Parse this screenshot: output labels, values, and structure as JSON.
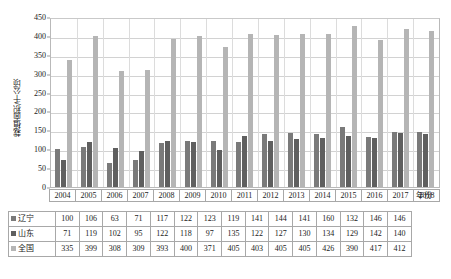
{
  "chart_data": {
    "type": "bar",
    "title": "",
    "xlabel": "年份",
    "ylabel": "栽植面积/千公顷",
    "ylim": [
      0,
      450
    ],
    "ytick_step": 50,
    "yticks": [
      0,
      50,
      100,
      150,
      200,
      250,
      300,
      350,
      400,
      450
    ],
    "grid": true,
    "legend_position": "table-rows",
    "categories": [
      "2004",
      "2005",
      "2006",
      "2007",
      "2008",
      "2009",
      "2010",
      "2011",
      "2012",
      "2013",
      "2014",
      "2015",
      "2016",
      "2017",
      "2018"
    ],
    "series": [
      {
        "name": "辽宁",
        "color": "#7a7a7a",
        "values": [
          100,
          106,
          63,
          71,
          117,
          122,
          123,
          119,
          141,
          144,
          141,
          160,
          132,
          146,
          146
        ]
      },
      {
        "name": "山东",
        "color": "#5f5f5f",
        "values": [
          71,
          119,
          102,
          95,
          122,
          118,
          97,
          135,
          122,
          127,
          130,
          134,
          129,
          142,
          140
        ]
      },
      {
        "name": "全国",
        "color": "#b5b5b5",
        "values": [
          335,
          399,
          308,
          309,
          393,
          400,
          371,
          405,
          403,
          405,
          405,
          426,
          390,
          417,
          412
        ]
      }
    ]
  },
  "axis": {
    "y_label": "栽植面积/千公顷",
    "x_unit_label": "年份",
    "y_tick_labels": [
      "450",
      "400",
      "350",
      "300",
      "250",
      "200",
      "150",
      "100",
      "50",
      "0"
    ]
  },
  "table": {
    "year_header": [
      "2004",
      "2005",
      "2006",
      "2007",
      "2008",
      "2009",
      "2010",
      "2011",
      "2012",
      "2013",
      "2014",
      "2015",
      "2016",
      "2017",
      "2018"
    ],
    "rows": [
      {
        "label": "辽宁",
        "swatch": "s0",
        "values": [
          "100",
          "106",
          "63",
          "71",
          "117",
          "122",
          "123",
          "119",
          "141",
          "144",
          "141",
          "160",
          "132",
          "146",
          "146"
        ]
      },
      {
        "label": "山东",
        "swatch": "s1",
        "values": [
          "71",
          "119",
          "102",
          "95",
          "122",
          "118",
          "97",
          "135",
          "122",
          "127",
          "130",
          "134",
          "129",
          "142",
          "140"
        ]
      },
      {
        "label": "全国",
        "swatch": "s2",
        "values": [
          "335",
          "399",
          "308",
          "309",
          "393",
          "400",
          "371",
          "405",
          "403",
          "405",
          "405",
          "426",
          "390",
          "417",
          "412"
        ]
      }
    ]
  },
  "colors": {
    "series_liaoning": "#7a7a7a",
    "series_shandong": "#5f5f5f",
    "series_national": "#b5b5b5",
    "gridline": "#d2d2d2",
    "border": "#a8a8a8"
  }
}
